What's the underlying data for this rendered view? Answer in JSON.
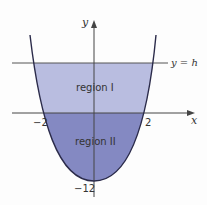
{
  "figure": {
    "axis_labels": {
      "x": "x",
      "y": "y"
    },
    "line_label": "y = h",
    "regions": [
      {
        "label": "region I",
        "color": "#b9bde0"
      },
      {
        "label": "region II",
        "color": "#8489c2"
      }
    ],
    "tick_labels": {
      "x_neg": "−2",
      "x_pos": "2",
      "y_min": "−12"
    },
    "colors": {
      "curve": "#2b2b4a",
      "axis": "#444444",
      "region_I": "#b9bde0",
      "region_II": "#8489c2"
    }
  }
}
